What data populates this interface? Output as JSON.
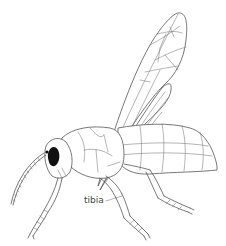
{
  "figure": {
    "labels": [
      {
        "id": "tibia",
        "text": "tibia",
        "x": 84,
        "y": 196
      }
    ]
  },
  "colors": {
    "line": "#555555",
    "eye": "#111111",
    "background": "#ffffff",
    "label": "#444444"
  }
}
